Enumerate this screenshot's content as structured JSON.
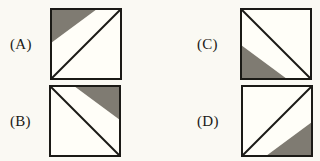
{
  "page": {
    "kind": "multiple-choice-figure-panel",
    "background_color": "#faf9f3",
    "ink_color": "#1b1a16",
    "shade_color": "#7f7b72",
    "square_fill_color": "#fffef8"
  },
  "choices": [
    {
      "id": "a",
      "label": "(A)",
      "figure_name": "square-diagonal-bl-tr-shaded-top-left",
      "diagonal": "bottom-left-to-top-right",
      "shaded_corner": "top-left",
      "shaded_triangle_points": "1,1 47,1 1,35",
      "diagonal_points": "1,71 71,1"
    },
    {
      "id": "b",
      "label": "(B)",
      "figure_name": "square-diagonal-tl-br-shaded-top-right",
      "diagonal": "top-left-to-bottom-right",
      "shaded_corner": "top-right",
      "shaded_triangle_points": "71,1 71,35 25,1",
      "diagonal_points": "1,1 71,71"
    },
    {
      "id": "c",
      "label": "(C)",
      "figure_name": "square-diagonal-tl-br-shaded-bottom-left",
      "diagonal": "top-left-to-bottom-right",
      "shaded_corner": "bottom-left",
      "shaded_triangle_points": "1,71 1,37 47,71",
      "diagonal_points": "1,1 71,71"
    },
    {
      "id": "d",
      "label": "(D)",
      "figure_name": "square-diagonal-bl-tr-shaded-bottom-right",
      "diagonal": "bottom-left-to-top-right",
      "shaded_corner": "bottom-right",
      "shaded_triangle_points": "71,71 25,71 71,37",
      "diagonal_points": "1,71 71,1"
    }
  ]
}
